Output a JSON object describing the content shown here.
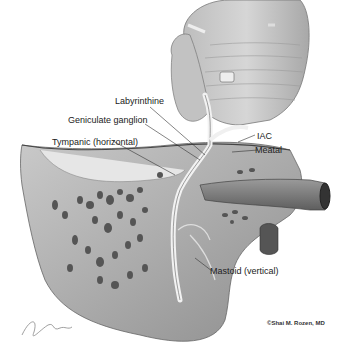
{
  "figure": {
    "labels": [
      {
        "id": "labyrinthine",
        "text": "Labyrinthine"
      },
      {
        "id": "geniculate",
        "text": "Geniculate ganglion"
      },
      {
        "id": "tympanic",
        "text": "Tympanic (horizontal)"
      },
      {
        "id": "iac",
        "text": "IAC"
      },
      {
        "id": "meatal",
        "text": "Meatal"
      },
      {
        "id": "mastoid",
        "text": "Mastoid (vertical)"
      }
    ],
    "copyright": "©Shai M. Rozen, MD",
    "signature": "signature"
  }
}
